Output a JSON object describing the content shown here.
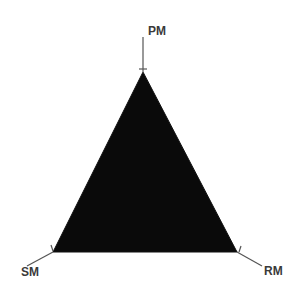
{
  "diagram": {
    "type": "ternary-triangle",
    "fill_color": "#0a0a0a",
    "line_color": "#555555",
    "label_color": "#3a3a3a",
    "vertices": [
      {
        "id": "top",
        "label": "PM"
      },
      {
        "id": "bottom-left",
        "label": "SM"
      },
      {
        "id": "bottom-right",
        "label": "RM"
      }
    ],
    "labels": {
      "top": "PM",
      "left": "SM",
      "right": "RM"
    }
  }
}
